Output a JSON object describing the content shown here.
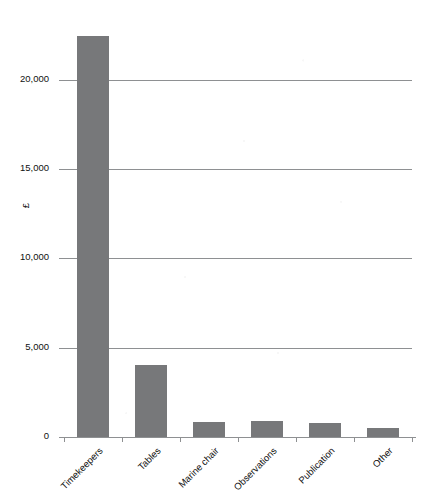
{
  "chart_data": {
    "type": "bar",
    "title": "",
    "subtitle": "",
    "xlabel": "",
    "ylabel": "£",
    "categories": [
      "Timekeepers",
      "Tables",
      "Marine chair",
      "Observations",
      "Publication",
      "Other"
    ],
    "values": [
      22450,
      4030,
      840,
      890,
      780,
      500
    ],
    "series": [
      {
        "name": "Amount",
        "values": [
          22450,
          4030,
          840,
          890,
          780,
          500
        ]
      }
    ],
    "ylim": [
      0,
      22500
    ],
    "yticks": [
      0,
      5000,
      10000,
      15000,
      20000
    ],
    "ytick_labels": [
      "0",
      "5,000",
      "10,000",
      "15,000",
      "20,000"
    ],
    "grid": true,
    "grid_axis": "y",
    "legend": false,
    "legend_position": "none",
    "bar_color": "#77787a",
    "gridline_color": "#8e9092",
    "axis_color": "#8e9092",
    "text_color": "#111111",
    "background": "#ffffff",
    "xtick_label_rotation": -45
  },
  "axes": {
    "y_title": "£"
  }
}
